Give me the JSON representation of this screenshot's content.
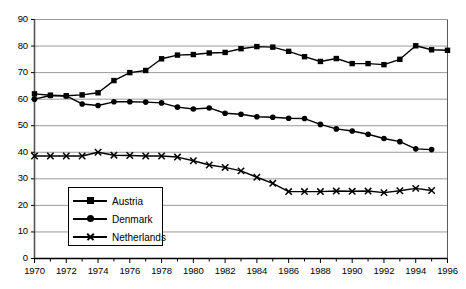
{
  "chart_data": {
    "type": "line",
    "title": "",
    "xlabel": "",
    "ylabel": "",
    "xlim": [
      1970,
      1996
    ],
    "ylim": [
      0,
      90
    ],
    "ytick_step": 10,
    "xtick_label_step": 2,
    "xtick_minor_step": 1,
    "grid": true,
    "grid_axis": "y",
    "legend_position": "lower-left-inside",
    "yticks": [
      0,
      10,
      20,
      30,
      40,
      50,
      60,
      70,
      80,
      90
    ],
    "xticks_labeled": [
      1970,
      1972,
      1974,
      1976,
      1978,
      1980,
      1982,
      1984,
      1986,
      1988,
      1990,
      1992,
      1994,
      1996
    ],
    "x": [
      1970,
      1971,
      1972,
      1973,
      1974,
      1975,
      1976,
      1977,
      1978,
      1979,
      1980,
      1981,
      1982,
      1983,
      1984,
      1985,
      1986,
      1987,
      1988,
      1989,
      1990,
      1991,
      1992,
      1993,
      1994,
      1995,
      1996
    ],
    "series": [
      {
        "name": "Austria",
        "marker": "square",
        "color": "#000000",
        "values": [
          62.0,
          61.5,
          61.3,
          61.6,
          62.4,
          67.0,
          70.0,
          70.8,
          75.2,
          76.6,
          76.8,
          77.4,
          77.6,
          79.0,
          79.8,
          79.6,
          78.0,
          76.0,
          74.2,
          75.3,
          73.4,
          73.4,
          73.0,
          75.0,
          80.1,
          78.6,
          78.4
        ]
      },
      {
        "name": "Denmark",
        "marker": "circle",
        "color": "#000000",
        "values": [
          60.0,
          61.4,
          61.2,
          58.2,
          57.6,
          59.0,
          59.0,
          58.9,
          58.6,
          57.0,
          56.3,
          56.7,
          54.7,
          54.3,
          53.4,
          53.2,
          52.8,
          52.7,
          50.5,
          48.8,
          48.0,
          46.8,
          45.2,
          44.0,
          41.3,
          41.0,
          null
        ]
      },
      {
        "name": "Netherlands",
        "marker": "cross",
        "color": "#000000",
        "values": [
          38.6,
          38.6,
          38.6,
          38.6,
          40.0,
          38.9,
          38.8,
          38.6,
          38.6,
          38.2,
          36.8,
          35.2,
          34.3,
          33.0,
          30.6,
          28.3,
          25.2,
          25.2,
          25.2,
          25.4,
          25.3,
          25.4,
          24.8,
          25.5,
          26.4,
          25.6,
          null
        ]
      }
    ]
  },
  "legend": {
    "items": [
      {
        "label": "Austria",
        "marker": "square"
      },
      {
        "label": "Denmark",
        "marker": "circle"
      },
      {
        "label": "Netherlands",
        "marker": "cross"
      }
    ]
  }
}
